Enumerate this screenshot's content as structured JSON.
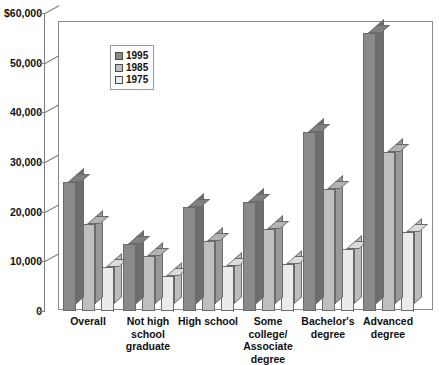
{
  "chart_data": {
    "type": "bar",
    "title": "",
    "subtitle": "",
    "xlabel": "",
    "ylabel": "",
    "ylim": [
      0,
      60000
    ],
    "ytick_labels": [
      "$60,000",
      "50,000",
      "40,000",
      "30,000",
      "20,000",
      "10,000",
      "0"
    ],
    "ytick_values": [
      60000,
      50000,
      40000,
      30000,
      20000,
      10000,
      0
    ],
    "grid": false,
    "legend_position": "upper-left-inside",
    "categories": [
      "Overall",
      "Not high school graduate",
      "High school",
      "Some college/ Associate degree",
      "Bachelor's degree",
      "Advanced degree"
    ],
    "category_label_lines": [
      [
        "Overall"
      ],
      [
        "Not high",
        "school",
        "graduate"
      ],
      [
        "High school"
      ],
      [
        "Some",
        "college/",
        "Associate",
        "degree"
      ],
      [
        "Bachelor's",
        "degree"
      ],
      [
        "Advanced",
        "degree"
      ]
    ],
    "series": [
      {
        "name": "1995",
        "color": "#8a8a8a",
        "values": [
          26000,
          13500,
          21000,
          22000,
          36000,
          56000
        ]
      },
      {
        "name": "1985",
        "color": "#bfbfbf",
        "values": [
          17500,
          11000,
          14000,
          16500,
          24500,
          32000
        ]
      },
      {
        "name": "1975",
        "color": "#ebebeb",
        "values": [
          8800,
          7000,
          9000,
          9500,
          12500,
          16000
        ]
      }
    ]
  },
  "legend": {
    "items": [
      {
        "label": "1995",
        "color": "#8a8a8a"
      },
      {
        "label": "1985",
        "color": "#bfbfbf"
      },
      {
        "label": "1975",
        "color": "#ebebeb"
      }
    ]
  },
  "colors": {
    "axis": "#7d7d7d",
    "frame": "#8a8a8a",
    "bar_outline": "#6b6b6b",
    "text": "#111111",
    "background": "#ffffff",
    "floor": "#9a9a9a",
    "wall": "#f2f2f2"
  }
}
